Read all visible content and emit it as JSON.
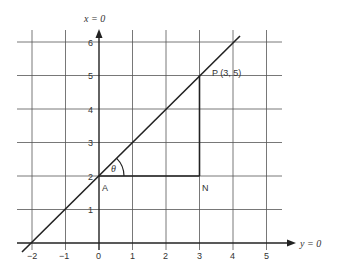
{
  "diagram": {
    "type": "coordinate-geometry",
    "axes": {
      "vertical_label": "x = 0",
      "horizontal_label": "y = 0",
      "x_ticks": [
        "−2",
        "−1",
        "0",
        "1",
        "2",
        "3",
        "4",
        "5"
      ],
      "y_ticks": [
        "1",
        "2",
        "3",
        "4",
        "5",
        "6"
      ]
    },
    "points": {
      "P": {
        "label": "P (3, 5)",
        "x": 3,
        "y": 5
      },
      "A": {
        "label": "A",
        "x": 0,
        "y": 2
      },
      "N": {
        "label": "N",
        "x": 3,
        "y": 2
      }
    },
    "angle_label": "θ",
    "line": {
      "description": "y = x + 2",
      "from": [
        -2,
        0
      ],
      "to": [
        4.2,
        6.2
      ]
    },
    "colors": {
      "ink": "#222222",
      "grid": "#555555",
      "background": "#ffffff"
    }
  }
}
